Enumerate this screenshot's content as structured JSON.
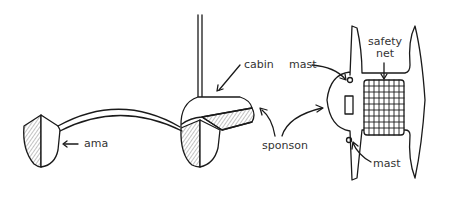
{
  "diagram": {
    "type": "labeled-line-drawing",
    "views": [
      {
        "name": "front-view",
        "labels": [
          "ama",
          "cabin",
          "sponson"
        ]
      },
      {
        "name": "top-view",
        "labels": [
          "mast",
          "safety net",
          "mast"
        ]
      }
    ]
  },
  "labels": {
    "ama": "ama",
    "cabin": "cabin",
    "sponson": "sponson",
    "mast_top": "mast",
    "mast_bottom": "mast",
    "safety_net_line1": "safety",
    "safety_net_line2": "net"
  },
  "colors": {
    "stroke": "#1a1a1a",
    "text": "#333333",
    "background": "#ffffff"
  }
}
